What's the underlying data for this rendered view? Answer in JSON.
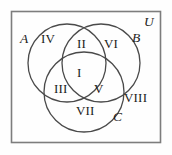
{
  "figure": {
    "kind": "three-set-venn-diagram",
    "universal_set_label": "U",
    "colors": {
      "stroke": "#4a4a4a",
      "rect_stroke": "#7a7a7a",
      "text": "#1c1c1c",
      "background": "#fefefe"
    },
    "set_labels": [
      {
        "id": "A",
        "text": "A"
      },
      {
        "id": "B",
        "text": "B"
      },
      {
        "id": "C",
        "text": "C"
      },
      {
        "id": "U",
        "text": "U"
      }
    ],
    "regions": [
      {
        "id": "I",
        "text": "I",
        "meaning": "A and B and C"
      },
      {
        "id": "II",
        "text": "II",
        "meaning": "A and B only"
      },
      {
        "id": "III",
        "text": "III",
        "meaning": "A and C only"
      },
      {
        "id": "IV",
        "text": "IV",
        "meaning": "A only"
      },
      {
        "id": "V",
        "text": "V",
        "meaning": "B and C only"
      },
      {
        "id": "VI",
        "text": "VI",
        "meaning": "B only"
      },
      {
        "id": "VII",
        "text": "VII",
        "meaning": "C only"
      },
      {
        "id": "VIII",
        "text": "VIII",
        "meaning": "outside all sets"
      }
    ]
  }
}
